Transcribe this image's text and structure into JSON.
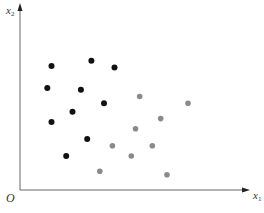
{
  "chart_data": {
    "type": "scatter",
    "title": "",
    "xlabel": "x1",
    "ylabel": "x2",
    "origin_label": "O",
    "grid": false,
    "legend": null,
    "axis_ranges": {
      "x": [
        0,
        10
      ],
      "y": [
        0,
        10
      ]
    },
    "series": [
      {
        "name": "class-black",
        "color": "#111111",
        "points": [
          [
            1.5,
            7.3
          ],
          [
            3.4,
            7.6
          ],
          [
            4.5,
            7.2
          ],
          [
            1.3,
            6.0
          ],
          [
            2.9,
            5.9
          ],
          [
            4.0,
            5.1
          ],
          [
            2.5,
            4.6
          ],
          [
            1.5,
            4.0
          ],
          [
            3.2,
            3.0
          ],
          [
            2.2,
            2.0
          ]
        ]
      },
      {
        "name": "class-gray",
        "color": "#8a8a8a",
        "points": [
          [
            5.7,
            5.5
          ],
          [
            8.0,
            5.1
          ],
          [
            6.7,
            4.2
          ],
          [
            5.5,
            3.6
          ],
          [
            4.4,
            2.6
          ],
          [
            6.3,
            2.6
          ],
          [
            5.3,
            2.0
          ],
          [
            3.8,
            1.1
          ],
          [
            7.0,
            0.9
          ]
        ]
      }
    ]
  },
  "labels": {
    "x_axis": "x",
    "x_axis_sub": "1",
    "y_axis": "x",
    "y_axis_sub": "2",
    "origin": "O"
  },
  "colors": {
    "axis": "#555555",
    "black_points": "#111111",
    "gray_points": "#8a8a8a"
  }
}
